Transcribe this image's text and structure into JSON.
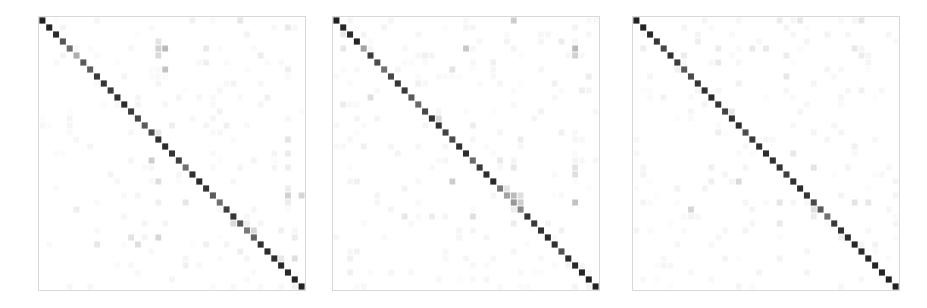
{
  "figure": {
    "title": "",
    "background_color": "#ffffff",
    "width": 927,
    "height": 308,
    "panel_count": 3,
    "panel_border_color": "#d8d8d8",
    "colormap": "greys",
    "colormap_min_color": "#ffffff",
    "colormap_max_color": "#1a1a1a"
  },
  "chart_data": {
    "type": "heatmap",
    "title": "",
    "xlabel": "",
    "ylabel": "",
    "grid": false,
    "legend": "none",
    "colorscale": {
      "name": "greys",
      "vmin": 0,
      "vmax": 1,
      "low_color": "#ffffff",
      "high_color": "#1a1a1a"
    },
    "n_classes": 39,
    "categories": [
      "0",
      "1",
      "2",
      "3",
      "4",
      "5",
      "6",
      "7",
      "8",
      "9",
      "10",
      "11",
      "12",
      "13",
      "14",
      "15",
      "16",
      "17",
      "18",
      "19",
      "20",
      "21",
      "22",
      "23",
      "24",
      "25",
      "26",
      "27",
      "28",
      "29",
      "30",
      "31",
      "32",
      "33",
      "34",
      "35",
      "36",
      "37",
      "38"
    ],
    "panels": [
      {
        "name": "confusion-matrix-1",
        "index": 0,
        "x": 38,
        "y": 16,
        "width": 268,
        "height": 275,
        "diagonal": [
          0.97,
          0.95,
          0.93,
          0.74,
          0.62,
          0.35,
          0.72,
          0.7,
          0.86,
          0.88,
          0.85,
          0.9,
          0.92,
          0.86,
          0.8,
          0.72,
          0.78,
          0.9,
          0.92,
          0.88,
          0.84,
          0.62,
          0.9,
          0.93,
          0.88,
          0.72,
          0.62,
          0.84,
          0.88,
          0.72,
          0.58,
          0.68,
          0.9,
          0.92,
          0.9,
          0.93,
          0.94,
          0.95,
          0.96
        ],
        "off_diagonal": [
          {
            "row": 0,
            "col": 22,
            "value": 0.06
          },
          {
            "row": 0,
            "col": 29,
            "value": 0.1
          },
          {
            "row": 1,
            "col": 36,
            "value": 0.09
          },
          {
            "row": 3,
            "col": 17,
            "value": 0.12
          },
          {
            "row": 4,
            "col": 17,
            "value": 0.2
          },
          {
            "row": 4,
            "col": 18,
            "value": 0.3
          },
          {
            "row": 4,
            "col": 24,
            "value": 0.09
          },
          {
            "row": 5,
            "col": 17,
            "value": 0.16
          },
          {
            "row": 5,
            "col": 32,
            "value": 0.08
          },
          {
            "row": 6,
            "col": 24,
            "value": 0.07
          },
          {
            "row": 7,
            "col": 18,
            "value": 0.26
          },
          {
            "row": 7,
            "col": 36,
            "value": 0.07
          },
          {
            "row": 15,
            "col": 19,
            "value": 0.07
          },
          {
            "row": 15,
            "col": 27,
            "value": 0.06
          },
          {
            "row": 16,
            "col": 17,
            "value": 0.1
          },
          {
            "row": 17,
            "col": 36,
            "value": 0.12
          },
          {
            "row": 19,
            "col": 36,
            "value": 0.08
          },
          {
            "row": 20,
            "col": 16,
            "value": 0.22
          },
          {
            "row": 21,
            "col": 36,
            "value": 0.07
          },
          {
            "row": 23,
            "col": 17,
            "value": 0.14
          },
          {
            "row": 24,
            "col": 36,
            "value": 0.08
          },
          {
            "row": 25,
            "col": 36,
            "value": 0.2
          },
          {
            "row": 25,
            "col": 38,
            "value": 0.18
          },
          {
            "row": 26,
            "col": 17,
            "value": 0.06
          },
          {
            "row": 26,
            "col": 21,
            "value": 0.11
          },
          {
            "row": 26,
            "col": 36,
            "value": 0.08
          },
          {
            "row": 27,
            "col": 5,
            "value": 0.07
          },
          {
            "row": 29,
            "col": 28,
            "value": 0.16
          },
          {
            "row": 29,
            "col": 30,
            "value": 0.07
          },
          {
            "row": 30,
            "col": 31,
            "value": 0.18
          },
          {
            "row": 30,
            "col": 35,
            "value": 0.06
          },
          {
            "row": 31,
            "col": 13,
            "value": 0.12
          },
          {
            "row": 31,
            "col": 17,
            "value": 0.18
          },
          {
            "row": 31,
            "col": 37,
            "value": 0.08
          },
          {
            "row": 32,
            "col": 8,
            "value": 0.1
          },
          {
            "row": 32,
            "col": 14,
            "value": 0.14
          },
          {
            "row": 32,
            "col": 24,
            "value": 0.06
          },
          {
            "row": 33,
            "col": 29,
            "value": 0.07
          },
          {
            "row": 34,
            "col": 35,
            "value": 0.1
          },
          {
            "row": 34,
            "col": 37,
            "value": 0.14
          },
          {
            "row": 35,
            "col": 21,
            "value": 0.06
          },
          {
            "row": 2,
            "col": 30,
            "value": 0.05
          },
          {
            "row": 9,
            "col": 28,
            "value": 0.05
          },
          {
            "row": 11,
            "col": 33,
            "value": 0.06
          },
          {
            "row": 13,
            "col": 26,
            "value": 0.05
          },
          {
            "row": 22,
            "col": 10,
            "value": 0.05
          },
          {
            "row": 28,
            "col": 12,
            "value": 0.04
          }
        ]
      },
      {
        "name": "confusion-matrix-2",
        "index": 1,
        "x": 332,
        "y": 16,
        "width": 268,
        "height": 275,
        "diagonal": [
          0.97,
          0.94,
          0.92,
          0.95,
          0.4,
          0.85,
          0.78,
          0.62,
          0.8,
          0.88,
          0.86,
          0.72,
          0.66,
          0.8,
          0.88,
          0.9,
          0.82,
          0.78,
          0.9,
          0.92,
          0.64,
          0.86,
          0.92,
          0.93,
          0.58,
          0.4,
          0.45,
          0.52,
          0.88,
          0.86,
          0.9,
          0.92,
          0.9,
          0.76,
          0.92,
          0.94,
          0.95,
          0.96,
          0.96
        ],
        "off_diagonal": [
          {
            "row": 0,
            "col": 26,
            "value": 0.22
          },
          {
            "row": 2,
            "col": 1,
            "value": 0.1
          },
          {
            "row": 3,
            "col": 33,
            "value": 0.08
          },
          {
            "row": 4,
            "col": 1,
            "value": 0.1
          },
          {
            "row": 4,
            "col": 19,
            "value": 0.24
          },
          {
            "row": 4,
            "col": 35,
            "value": 0.3
          },
          {
            "row": 5,
            "col": 35,
            "value": 0.2
          },
          {
            "row": 5,
            "col": 13,
            "value": 0.06
          },
          {
            "row": 6,
            "col": 23,
            "value": 0.06
          },
          {
            "row": 7,
            "col": 17,
            "value": 0.12
          },
          {
            "row": 8,
            "col": 37,
            "value": 0.08
          },
          {
            "row": 9,
            "col": 12,
            "value": 0.06
          },
          {
            "row": 9,
            "col": 32,
            "value": 0.06
          },
          {
            "row": 10,
            "col": 36,
            "value": 0.07
          },
          {
            "row": 11,
            "col": 5,
            "value": 0.14
          },
          {
            "row": 12,
            "col": 1,
            "value": 0.08
          },
          {
            "row": 14,
            "col": 15,
            "value": 0.16
          },
          {
            "row": 15,
            "col": 20,
            "value": 0.08
          },
          {
            "row": 16,
            "col": 33,
            "value": 0.06
          },
          {
            "row": 17,
            "col": 27,
            "value": 0.08
          },
          {
            "row": 18,
            "col": 4,
            "value": 0.06
          },
          {
            "row": 20,
            "col": 24,
            "value": 0.09
          },
          {
            "row": 21,
            "col": 26,
            "value": 0.1
          },
          {
            "row": 21,
            "col": 35,
            "value": 0.12
          },
          {
            "row": 22,
            "col": 35,
            "value": 0.14
          },
          {
            "row": 23,
            "col": 3,
            "value": 0.06
          },
          {
            "row": 23,
            "col": 17,
            "value": 0.22
          },
          {
            "row": 24,
            "col": 25,
            "value": 0.12
          },
          {
            "row": 25,
            "col": 26,
            "value": 0.3
          },
          {
            "row": 25,
            "col": 27,
            "value": 0.14
          },
          {
            "row": 26,
            "col": 27,
            "value": 0.22
          },
          {
            "row": 26,
            "col": 35,
            "value": 0.26
          },
          {
            "row": 27,
            "col": 26,
            "value": 0.08
          },
          {
            "row": 28,
            "col": 10,
            "value": 0.1
          },
          {
            "row": 28,
            "col": 14,
            "value": 0.08
          },
          {
            "row": 28,
            "col": 20,
            "value": 0.14
          },
          {
            "row": 29,
            "col": 26,
            "value": 0.08
          },
          {
            "row": 30,
            "col": 33,
            "value": 0.06
          },
          {
            "row": 33,
            "col": 3,
            "value": 0.05
          },
          {
            "row": 34,
            "col": 2,
            "value": 0.06
          },
          {
            "row": 1,
            "col": 35,
            "value": 0.05
          },
          {
            "row": 13,
            "col": 30,
            "value": 0.05
          },
          {
            "row": 19,
            "col": 9,
            "value": 0.05
          },
          {
            "row": 31,
            "col": 18,
            "value": 0.04
          },
          {
            "row": 36,
            "col": 2,
            "value": 0.06
          }
        ]
      },
      {
        "name": "confusion-matrix-3",
        "index": 2,
        "x": 632,
        "y": 16,
        "width": 268,
        "height": 275,
        "diagonal": [
          0.97,
          0.95,
          0.94,
          0.88,
          0.8,
          0.9,
          0.85,
          0.72,
          0.78,
          0.88,
          0.9,
          0.92,
          0.88,
          0.82,
          0.9,
          0.92,
          0.78,
          0.86,
          0.9,
          0.92,
          0.9,
          0.88,
          0.84,
          0.9,
          0.92,
          0.88,
          0.8,
          0.72,
          0.62,
          0.86,
          0.9,
          0.92,
          0.94,
          0.92,
          0.94,
          0.95,
          0.95,
          0.96,
          0.96
        ],
        "off_diagonal": [
          {
            "row": 0,
            "col": 21,
            "value": 0.08
          },
          {
            "row": 0,
            "col": 24,
            "value": 0.1
          },
          {
            "row": 0,
            "col": 33,
            "value": 0.11
          },
          {
            "row": 3,
            "col": 9,
            "value": 0.07
          },
          {
            "row": 4,
            "col": 1,
            "value": 0.07
          },
          {
            "row": 4,
            "col": 12,
            "value": 0.08
          },
          {
            "row": 4,
            "col": 17,
            "value": 0.09
          },
          {
            "row": 4,
            "col": 19,
            "value": 0.09
          },
          {
            "row": 4,
            "col": 32,
            "value": 0.1
          },
          {
            "row": 5,
            "col": 7,
            "value": 0.08
          },
          {
            "row": 5,
            "col": 22,
            "value": 0.08
          },
          {
            "row": 5,
            "col": 33,
            "value": 0.08
          },
          {
            "row": 6,
            "col": 12,
            "value": 0.09
          },
          {
            "row": 7,
            "col": 6,
            "value": 0.06
          },
          {
            "row": 8,
            "col": 22,
            "value": 0.1
          },
          {
            "row": 9,
            "col": 15,
            "value": 0.06
          },
          {
            "row": 10,
            "col": 33,
            "value": 0.06
          },
          {
            "row": 13,
            "col": 14,
            "value": 0.1
          },
          {
            "row": 16,
            "col": 12,
            "value": 0.07
          },
          {
            "row": 18,
            "col": 32,
            "value": 0.06
          },
          {
            "row": 19,
            "col": 23,
            "value": 0.1
          },
          {
            "row": 21,
            "col": 11,
            "value": 0.06
          },
          {
            "row": 21,
            "col": 26,
            "value": 0.12
          },
          {
            "row": 22,
            "col": 1,
            "value": 0.05
          },
          {
            "row": 23,
            "col": 11,
            "value": 0.07
          },
          {
            "row": 23,
            "col": 15,
            "value": 0.16
          },
          {
            "row": 26,
            "col": 21,
            "value": 0.11
          },
          {
            "row": 26,
            "col": 32,
            "value": 0.12
          },
          {
            "row": 26,
            "col": 34,
            "value": 0.1
          },
          {
            "row": 27,
            "col": 8,
            "value": 0.18
          },
          {
            "row": 27,
            "col": 26,
            "value": 0.14
          },
          {
            "row": 28,
            "col": 26,
            "value": 0.08
          },
          {
            "row": 29,
            "col": 21,
            "value": 0.09
          },
          {
            "row": 30,
            "col": 16,
            "value": 0.05
          },
          {
            "row": 34,
            "col": 21,
            "value": 0.05
          },
          {
            "row": 2,
            "col": 28,
            "value": 0.05
          },
          {
            "row": 11,
            "col": 4,
            "value": 0.05
          },
          {
            "row": 15,
            "col": 29,
            "value": 0.04
          },
          {
            "row": 24,
            "col": 6,
            "value": 0.05
          },
          {
            "row": 31,
            "col": 30,
            "value": 0.06
          }
        ]
      }
    ]
  }
}
